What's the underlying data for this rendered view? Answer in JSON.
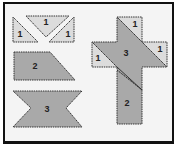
{
  "colors": {
    "light_piece": "#dcdcdc",
    "dark_piece": "#a9a9a9",
    "outline": "#333333",
    "background": "#f4f4f4",
    "frame": "#111111"
  },
  "pieces": [
    {
      "id": "triangle-left",
      "label": "1",
      "shade": "light"
    },
    {
      "id": "triangle-top",
      "label": "1",
      "shade": "light"
    },
    {
      "id": "triangle-right",
      "label": "1",
      "shade": "light"
    },
    {
      "id": "trapezoid",
      "label": "2",
      "shade": "dark"
    },
    {
      "id": "bowtie",
      "label": "3",
      "shade": "dark"
    }
  ],
  "cross": {
    "pieces": [
      {
        "id": "cross-top-triangle",
        "label": "1"
      },
      {
        "id": "cross-left-triangle",
        "label": "1"
      },
      {
        "id": "cross-right-triangle",
        "label": "1"
      },
      {
        "id": "cross-center",
        "label": "3"
      },
      {
        "id": "cross-bottom",
        "label": "2"
      }
    ]
  }
}
